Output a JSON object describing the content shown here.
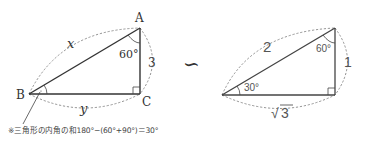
{
  "left_triangle": {
    "vertex_a": "A",
    "vertex_b": "B",
    "vertex_c": "C",
    "angle_a": "60°",
    "side_ab": "x",
    "side_ac": "3",
    "side_bc": "y"
  },
  "similar_symbol": "∽",
  "right_triangle": {
    "angle_left": "30°",
    "angle_top": "60°",
    "hypotenuse": "2",
    "vertical_side": "1",
    "base_side": "3",
    "base_radical": "√"
  },
  "note": "※三角形の内角の和180°−(60°+90°)＝30°"
}
